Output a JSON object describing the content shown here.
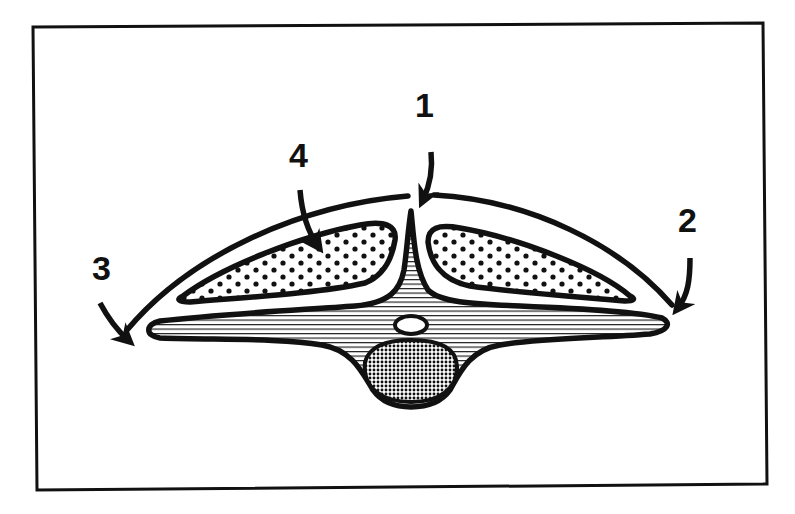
{
  "diagram": {
    "type": "anatomical cross-section schematic",
    "colors": {
      "ink": "#111111",
      "background": "#ffffff"
    },
    "labels": [
      {
        "id": "1",
        "text": "1",
        "x": 425,
        "y": 117,
        "points_to": "midline notch at top of outer arc"
      },
      {
        "id": "2",
        "text": "2",
        "x": 688,
        "y": 232,
        "points_to": "right lateral edge of outer arc"
      },
      {
        "id": "3",
        "text": "3",
        "x": 103,
        "y": 280,
        "points_to": "left lateral edge of outer arc"
      },
      {
        "id": "4",
        "text": "4",
        "x": 299,
        "y": 167,
        "points_to": "left dotted lobe"
      }
    ],
    "regions": [
      {
        "name": "outer-arc",
        "fill": "none"
      },
      {
        "name": "left-dotted-lobe",
        "fill": "dots"
      },
      {
        "name": "right-dotted-lobe",
        "fill": "dots"
      },
      {
        "name": "central-striped-body",
        "fill": "horizontal-lines"
      },
      {
        "name": "small-white-oval",
        "fill": "white"
      },
      {
        "name": "crosshatched-oval",
        "fill": "dense-dots"
      }
    ]
  }
}
